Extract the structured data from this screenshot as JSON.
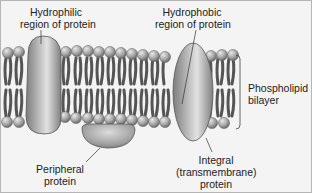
{
  "diagram": {
    "labels": {
      "hydrophilic": [
        "Hydrophilic",
        "region of protein"
      ],
      "hydrophobic": [
        "Hydrophobic",
        "region of protein"
      ],
      "bilayer": [
        "Phospholipid",
        "bilayer"
      ],
      "peripheral": [
        "Peripheral",
        "protein"
      ],
      "integral": [
        "Integral",
        "(transmembrane)",
        "protein"
      ]
    },
    "colors": {
      "background": "#f4f4f4",
      "lipid_head": "#a8a8a8",
      "lipid_tail": "#5a5a5a",
      "protein": "#9a9a9a",
      "border": "#b5b5b5",
      "leader_line": "#333333"
    }
  }
}
